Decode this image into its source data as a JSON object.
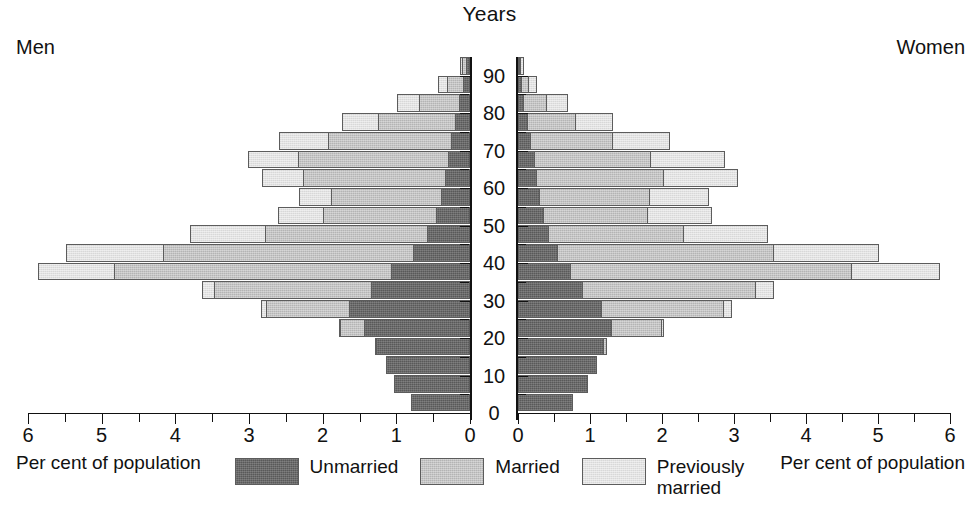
{
  "header": {
    "years_label": "Years",
    "men_label": "Men",
    "women_label": "Women"
  },
  "axes": {
    "left_caption": "Per cent of\npopulation",
    "right_caption": "Per cent of\npopulation",
    "value_ticks": [
      0,
      1,
      2,
      3,
      4,
      5,
      6
    ],
    "left_value_labels": [
      "6",
      "5",
      "4",
      "3",
      "2",
      "1",
      "0"
    ],
    "right_value_labels": [
      "0",
      "1",
      "2",
      "3",
      "4",
      "5",
      "6"
    ],
    "age_labels": [
      "0",
      "10",
      "20",
      "30",
      "40",
      "50",
      "60",
      "70",
      "80",
      "90"
    ],
    "value_minor_step": 0.5,
    "age_minor_step": 5
  },
  "legend": {
    "position": "bottom-center",
    "items": [
      {
        "label": "Unmarried",
        "color": "#595959",
        "key": "unmarried"
      },
      {
        "label": "Married",
        "color": "#b4b4b4",
        "key": "married"
      },
      {
        "label": "Previously\nmarried",
        "color": "#e2e2e2",
        "key": "previously"
      }
    ]
  },
  "chart_data": {
    "type": "bar",
    "subtype": "population-pyramid-stacked-horizontal",
    "title": "",
    "xlabel": "Per cent of population",
    "ylabel": "Years",
    "xlim": [
      0,
      6
    ],
    "ylim": [
      0,
      95
    ],
    "grid": false,
    "categories": [
      "0-4",
      "5-9",
      "10-14",
      "15-19",
      "20-24",
      "25-29",
      "30-34",
      "35-39",
      "40-44",
      "45-49",
      "50-54",
      "55-59",
      "60-64",
      "65-69",
      "70-74",
      "75-79",
      "80-84",
      "85-89",
      "90+"
    ],
    "series_names": [
      "Unmarried",
      "Married",
      "Previously married"
    ],
    "panels": [
      {
        "name": "Men",
        "side": "left",
        "series": [
          {
            "name": "Unmarried",
            "values": [
              0.8,
              1.03,
              1.14,
              1.26,
              1.42,
              1.63,
              1.33,
              1.06,
              0.76,
              0.57,
              0.45,
              0.38,
              0.33,
              0.29,
              0.24,
              0.19,
              0.13,
              0.08,
              0.04
            ]
          },
          {
            "name": "Married",
            "values": [
              0.0,
              0.0,
              0.0,
              0.01,
              0.33,
              1.13,
              2.13,
              3.76,
              3.4,
              2.2,
              1.53,
              1.49,
              1.93,
              2.03,
              1.68,
              1.05,
              0.55,
              0.22,
              0.06
            ]
          },
          {
            "name": "Previously married",
            "values": [
              0.0,
              0.0,
              0.0,
              0.0,
              0.02,
              0.08,
              0.18,
              1.04,
              1.32,
              1.03,
              0.63,
              0.45,
              0.57,
              0.7,
              0.68,
              0.5,
              0.31,
              0.14,
              0.04
            ]
          }
        ],
        "totals": [
          0.8,
          1.03,
          1.14,
          1.27,
          1.77,
          2.84,
          3.64,
          5.86,
          5.48,
          3.8,
          2.61,
          2.32,
          2.83,
          3.02,
          2.6,
          1.74,
          0.99,
          0.44,
          0.14
        ]
      },
      {
        "name": "Women",
        "side": "right",
        "series": [
          {
            "name": "Unmarried",
            "values": [
              0.77,
              0.97,
              1.1,
              1.2,
              1.31,
              1.16,
              0.9,
              0.73,
              0.55,
              0.43,
              0.36,
              0.31,
              0.27,
              0.23,
              0.18,
              0.14,
              0.09,
              0.05,
              0.02
            ]
          },
          {
            "name": "Married",
            "values": [
              0.0,
              0.0,
              0.0,
              0.04,
              0.69,
              1.7,
              2.4,
              3.91,
              3.0,
              1.88,
              1.45,
              1.52,
              1.76,
              1.62,
              1.14,
              0.66,
              0.31,
              0.1,
              0.02
            ]
          },
          {
            "name": "Previously married",
            "values": [
              0.0,
              0.0,
              0.0,
              0.0,
              0.03,
              0.11,
              0.25,
              1.22,
              1.46,
              1.16,
              0.88,
              0.82,
              1.02,
              1.02,
              0.79,
              0.52,
              0.3,
              0.12,
              0.03
            ]
          }
        ],
        "totals": [
          0.77,
          0.97,
          1.1,
          1.24,
          2.03,
          2.97,
          3.55,
          5.86,
          5.01,
          3.47,
          2.69,
          2.65,
          3.05,
          2.87,
          2.11,
          1.32,
          0.7,
          0.27,
          0.07
        ]
      }
    ]
  }
}
